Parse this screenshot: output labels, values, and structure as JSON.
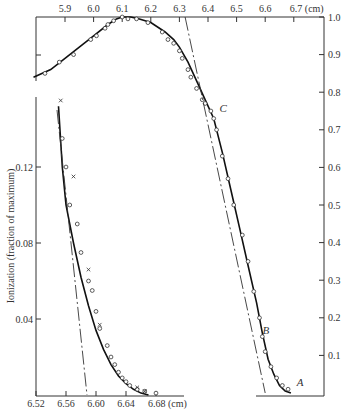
{
  "chart_data": [
    {
      "name": "main-curve",
      "type": "line",
      "title": "",
      "xlabel": "(cm)",
      "ylabel": "",
      "x_axis_position": "top",
      "y_axis_position": "right",
      "xlim": [
        5.8,
        6.8
      ],
      "ylim": [
        0,
        1.0
      ],
      "x_ticks": [
        5.9,
        6.0,
        6.1,
        6.2,
        6.3,
        6.4,
        6.5,
        6.6,
        6.7
      ],
      "x_tick_labels": [
        "5.9",
        "6.0",
        "6.1",
        "6.2",
        "6.3",
        "6.4",
        "6.5",
        "6.6",
        "6.7 (cm)"
      ],
      "y_ticks": [
        0.1,
        0.2,
        0.3,
        0.4,
        0.5,
        0.6,
        0.7,
        0.8,
        0.9,
        1.0
      ],
      "y_tick_labels": [
        "0.1",
        "0.2",
        "0.3",
        "0.4",
        "0.5",
        "0.6",
        "0.7",
        "0.8",
        "0.9",
        "1.0"
      ],
      "grid": false,
      "series": [
        {
          "name": "fitted-curve",
          "style": "solid",
          "x": [
            5.79,
            5.85,
            5.9,
            5.95,
            6.0,
            6.05,
            6.08,
            6.1,
            6.13,
            6.16,
            6.2,
            6.25,
            6.28,
            6.3,
            6.33,
            6.36,
            6.39,
            6.42,
            6.45,
            6.48,
            6.51,
            6.54,
            6.57,
            6.59,
            6.61,
            6.63,
            6.65,
            6.67,
            6.69
          ],
          "y": [
            0.84,
            0.86,
            0.89,
            0.92,
            0.95,
            0.98,
            0.995,
            1.0,
            1.0,
            0.995,
            0.985,
            0.96,
            0.94,
            0.92,
            0.88,
            0.83,
            0.78,
            0.73,
            0.64,
            0.54,
            0.44,
            0.34,
            0.24,
            0.16,
            0.09,
            0.05,
            0.02,
            0.005,
            0.0
          ]
        },
        {
          "name": "measured-points",
          "style": "open-circle",
          "x": [
            5.83,
            5.88,
            5.93,
            5.99,
            6.01,
            6.04,
            6.05,
            6.07,
            6.1,
            6.12,
            6.15,
            6.19,
            6.24,
            6.26,
            6.28,
            6.3,
            6.31,
            6.33,
            6.34,
            6.36,
            6.38,
            6.39,
            6.41,
            6.42,
            6.43,
            6.45,
            6.47,
            6.49,
            6.52,
            6.54,
            6.56,
            6.58,
            6.59,
            6.6,
            6.62,
            6.64,
            6.66,
            6.68
          ],
          "y": [
            0.85,
            0.88,
            0.9,
            0.94,
            0.95,
            0.97,
            0.98,
            0.99,
            1.0,
            0.995,
            0.995,
            0.985,
            0.96,
            0.94,
            0.93,
            0.91,
            0.89,
            0.86,
            0.84,
            0.81,
            0.78,
            0.77,
            0.75,
            0.73,
            0.7,
            0.63,
            0.57,
            0.5,
            0.42,
            0.35,
            0.27,
            0.2,
            0.15,
            0.11,
            0.07,
            0.04,
            0.02,
            0.01
          ]
        },
        {
          "name": "tangent-line",
          "style": "dash-dot",
          "x": [
            6.32,
            6.6
          ],
          "y": [
            1.0,
            0.0
          ]
        }
      ],
      "annotations": [
        {
          "label": "C",
          "x": 6.43,
          "y": 0.74
        },
        {
          "label": "B",
          "x": 6.58,
          "y": 0.15
        },
        {
          "label": "A",
          "x": 6.7,
          "y": 0.01
        }
      ]
    },
    {
      "name": "inset-tail",
      "type": "line",
      "title": "",
      "xlabel": "(cm)",
      "ylabel": "Ionization (fraction of maximum)",
      "x_axis_position": "bottom",
      "y_axis_position": "left",
      "xlim": [
        6.52,
        6.8
      ],
      "ylim": [
        0,
        0.14
      ],
      "x_ticks": [
        6.52,
        6.56,
        6.6,
        6.64,
        6.68
      ],
      "x_tick_labels": [
        "6.52",
        "6.56",
        "6.60",
        "6.64",
        "6.68 (cm)"
      ],
      "y_ticks": [
        0.04,
        0.08,
        0.12
      ],
      "y_tick_labels": [
        "0.04",
        "0.08",
        "0.12"
      ],
      "grid": false,
      "series": [
        {
          "name": "fitted-curve",
          "style": "solid",
          "x": [
            6.55,
            6.555,
            6.56,
            6.57,
            6.58,
            6.59,
            6.6,
            6.61,
            6.62,
            6.63,
            6.64,
            6.65,
            6.66,
            6.67
          ],
          "y": [
            0.152,
            0.12,
            0.1,
            0.08,
            0.062,
            0.047,
            0.034,
            0.024,
            0.016,
            0.01,
            0.006,
            0.003,
            0.001,
            0.0
          ]
        },
        {
          "name": "circle-points",
          "style": "open-circle",
          "x": [
            6.555,
            6.56,
            6.565,
            6.575,
            6.58,
            6.59,
            6.595,
            6.6,
            6.605,
            6.615,
            6.62,
            6.625,
            6.63,
            6.635,
            6.64,
            6.645,
            6.655,
            6.665,
            6.68
          ],
          "y": [
            0.135,
            0.12,
            0.1,
            0.09,
            0.075,
            0.06,
            0.055,
            0.044,
            0.035,
            0.026,
            0.02,
            0.016,
            0.012,
            0.009,
            0.007,
            0.005,
            0.003,
            0.002,
            0.001
          ]
        },
        {
          "name": "cross-points",
          "style": "x",
          "x": [
            6.553,
            6.57,
            6.59,
            6.605,
            6.655,
            6.665
          ],
          "y": [
            0.155,
            0.115,
            0.066,
            0.037,
            0.004,
            0.002
          ]
        },
        {
          "name": "tangent-line",
          "style": "dash-dot",
          "x": [
            6.548,
            6.588
          ],
          "y": [
            0.15,
            0.0
          ]
        }
      ]
    }
  ]
}
